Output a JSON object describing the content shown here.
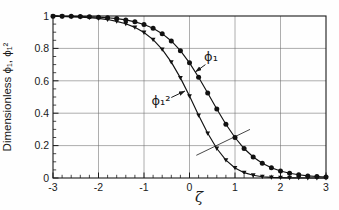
{
  "figure": {
    "background": "#fefefe",
    "axis_color": "#1a1a1a",
    "grid_color": "#6b6b6b",
    "curve_color": "#111111",
    "annotation_color": "#333333"
  },
  "chart_data": {
    "type": "line",
    "title": "",
    "xlabel": "ζ",
    "ylabel": "Dimensionless  ϕ₁, ϕ₁²",
    "xlim": [
      -3,
      3
    ],
    "ylim": [
      0,
      1
    ],
    "grid": true,
    "legend_position": "none",
    "x_major_ticks": [
      -3,
      -2,
      -1,
      0,
      1,
      2,
      3
    ],
    "x_tick_labels": [
      "-3",
      "-2",
      "-1",
      "0",
      "1",
      "2",
      "3"
    ],
    "y_major_ticks": [
      0,
      0.2,
      0.4,
      0.6,
      0.8,
      1
    ],
    "y_tick_labels": [
      "0",
      "0.2",
      "0.4",
      "0.6",
      "0.8",
      "1"
    ],
    "x_minor_step": 0.2,
    "y_minor_step": 0.05,
    "x": [
      -3,
      -2.8,
      -2.6,
      -2.4,
      -2.2,
      -2,
      -1.8,
      -1.6,
      -1.4,
      -1.2,
      -1,
      -0.8,
      -0.6,
      -0.4,
      -0.2,
      0,
      0.2,
      0.4,
      0.6,
      0.8,
      1,
      1.2,
      1.4,
      1.6,
      1.8,
      2,
      2.2,
      2.4,
      2.6,
      2.8,
      3
    ],
    "series": [
      {
        "name": "ϕ₁",
        "marker": "circle",
        "values": [
          0.999,
          0.998,
          0.998,
          0.997,
          0.995,
          0.993,
          0.989,
          0.984,
          0.976,
          0.964,
          0.948,
          0.924,
          0.891,
          0.846,
          0.786,
          0.711,
          0.622,
          0.525,
          0.426,
          0.332,
          0.25,
          0.182,
          0.13,
          0.091,
          0.063,
          0.043,
          0.029,
          0.02,
          0.013,
          0.009,
          0.006
        ]
      },
      {
        "name": "ϕ₁²",
        "marker": "triangle-down",
        "values": [
          0.998,
          0.997,
          0.995,
          0.993,
          0.99,
          0.985,
          0.978,
          0.967,
          0.952,
          0.93,
          0.898,
          0.854,
          0.794,
          0.715,
          0.618,
          0.506,
          0.387,
          0.276,
          0.182,
          0.11,
          0.062,
          0.033,
          0.017,
          0.008,
          0.004,
          0.002,
          0.001,
          0.001,
          0,
          0,
          0
        ]
      }
    ],
    "annotations": {
      "phi1_label": {
        "text": "ϕ₁",
        "x": 0.47,
        "y": 0.75,
        "arrow_from": {
          "x": 0.35,
          "y": 0.7
        },
        "arrow_to": {
          "x": 0.13,
          "y": 0.655
        }
      },
      "phi1sq_label": {
        "text": "ϕ₁²",
        "x": -0.62,
        "y": 0.48,
        "arrow_from": {
          "x": -0.4,
          "y": 0.497
        },
        "arrow_to": {
          "x": -0.1,
          "y": 0.537
        }
      },
      "cross_line": {
        "x1": 0.15,
        "y1": 0.14,
        "x2": 1.33,
        "y2": 0.3
      }
    }
  }
}
